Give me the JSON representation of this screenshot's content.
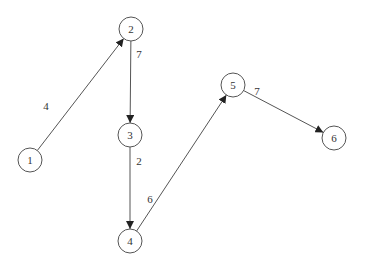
{
  "graph": {
    "nodes": [
      {
        "id": "1",
        "label": "1",
        "x": 30,
        "y": 160
      },
      {
        "id": "2",
        "label": "2",
        "x": 131,
        "y": 29
      },
      {
        "id": "3",
        "label": "3",
        "x": 130,
        "y": 135
      },
      {
        "id": "4",
        "label": "4",
        "x": 130,
        "y": 241
      },
      {
        "id": "5",
        "label": "5",
        "x": 233,
        "y": 85
      },
      {
        "id": "6",
        "label": "6",
        "x": 334,
        "y": 138
      }
    ],
    "edges": [
      {
        "from": "1",
        "to": "2",
        "weight": "4",
        "lx": 46,
        "ly": 107
      },
      {
        "from": "2",
        "to": "3",
        "weight": "7",
        "lx": 139,
        "ly": 55
      },
      {
        "from": "3",
        "to": "4",
        "weight": "2",
        "lx": 139,
        "ly": 162
      },
      {
        "from": "4",
        "to": "5",
        "weight": "6",
        "lx": 150,
        "ly": 200
      },
      {
        "from": "5",
        "to": "6",
        "weight": "7",
        "lx": 257,
        "ly": 92
      }
    ]
  }
}
